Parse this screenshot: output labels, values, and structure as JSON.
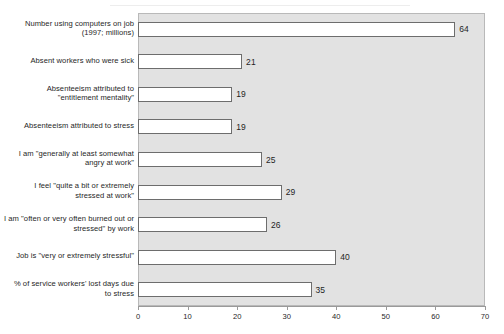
{
  "chart_data": {
    "type": "bar",
    "orientation": "horizontal",
    "title": "",
    "subtitle": "",
    "xlabel": "",
    "ylabel": "",
    "xlim": [
      0,
      70
    ],
    "xticks": [
      0,
      10,
      20,
      30,
      40,
      50,
      60,
      70
    ],
    "xtick_labels": [
      "0",
      "10",
      "20",
      "30",
      "40",
      "50",
      "60",
      "70"
    ],
    "grid": false,
    "legend": "none",
    "plot_background": "#e2e2e2",
    "bar_fill": "#ffffff",
    "bar_border": "#6d6d6d",
    "categories": [
      "Number using computers on job (1997; millions)",
      "Absent workers who were sick",
      "Absenteeism attributed to \"entitlement mentality\"",
      "Absenteeism attributed to stress",
      "I am \"generally at least somewhat angry at work\"",
      "I feel \"quite a bit or extremely stressed at work\"",
      "I am \"often or very often burned out or stressed\" by work",
      "Job is \"very or extremely stressful\"",
      "% of service workers' lost days due to stress"
    ],
    "values": [
      64,
      21,
      19,
      19,
      25,
      29,
      26,
      40,
      35
    ],
    "value_labels": [
      "64",
      "21",
      "19",
      "19",
      "25",
      "29",
      "26",
      "40",
      "35"
    ],
    "bars": [
      {
        "label_lines": [
          "Number using computers on job",
          "(1997; millions)"
        ],
        "value": 64,
        "value_label": "64"
      },
      {
        "label_lines": [
          "Absent workers who were sick"
        ],
        "value": 21,
        "value_label": "21"
      },
      {
        "label_lines": [
          "Absenteeism attributed to",
          "\"entitlement mentality\""
        ],
        "value": 19,
        "value_label": "19"
      },
      {
        "label_lines": [
          "Absenteeism attributed to stress"
        ],
        "value": 19,
        "value_label": "19"
      },
      {
        "label_lines": [
          "I am \"generally at least somewhat",
          "angry at work\""
        ],
        "value": 25,
        "value_label": "25"
      },
      {
        "label_lines": [
          "I feel \"quite a bit or extremely",
          "stressed at work\""
        ],
        "value": 29,
        "value_label": "29"
      },
      {
        "label_lines": [
          "I am \"often or very often burned out or",
          "stressed\" by work"
        ],
        "value": 26,
        "value_label": "26"
      },
      {
        "label_lines": [
          "Job is \"very or extremely stressful\""
        ],
        "value": 40,
        "value_label": "40"
      },
      {
        "label_lines": [
          "% of service workers' lost days due",
          "to stress"
        ],
        "value": 35,
        "value_label": "35"
      }
    ]
  }
}
